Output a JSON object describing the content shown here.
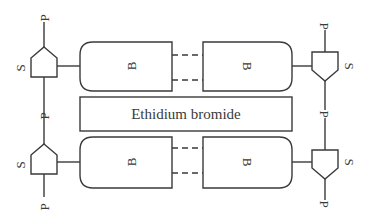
{
  "diagram": {
    "center_label": "Ethidium bromide",
    "base_label": "B",
    "sugar_label": "S",
    "phosphate_label": "P",
    "strands": [
      {
        "position": "top",
        "left_unit": {
          "sugar": "S",
          "phosphate_top": "P",
          "phosphate_bottom": ""
        },
        "left_base": "B",
        "right_base": "B",
        "right_unit": {
          "sugar": "S",
          "phosphate_top": "P",
          "phosphate_bottom": ""
        }
      },
      {
        "position": "bottom",
        "left_unit": {
          "sugar": "S",
          "phosphate_top": "",
          "phosphate_bottom": "P"
        },
        "left_base": "B",
        "right_base": "B",
        "right_unit": {
          "sugar": "S",
          "phosphate_top": "P",
          "phosphate_bottom": "P"
        }
      }
    ],
    "colors": {
      "stroke": "#3a3a3a",
      "background": "#ffffff"
    }
  }
}
